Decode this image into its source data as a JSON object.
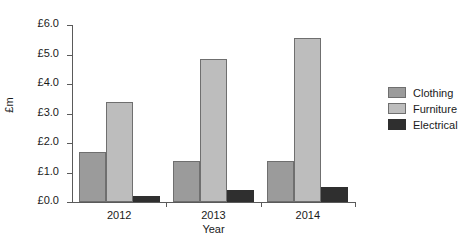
{
  "chart_data": {
    "type": "bar",
    "title": "",
    "xlabel": "Year",
    "ylabel": "£m",
    "categories": [
      "2012",
      "2013",
      "2014"
    ],
    "series": [
      {
        "name": "Clothing",
        "color": "#9b9b9b",
        "values": [
          1.7,
          1.4,
          1.4
        ]
      },
      {
        "name": "Furniture",
        "color": "#bdbdbd",
        "values": [
          3.4,
          4.85,
          5.55
        ]
      },
      {
        "name": "Electrical",
        "color": "#2f2f2f",
        "values": [
          0.2,
          0.4,
          0.5
        ]
      }
    ],
    "ylim": [
      0,
      6
    ],
    "ytick_values": [
      0,
      1,
      2,
      3,
      4,
      5,
      6
    ],
    "ytick_labels": [
      "£0.0",
      "£1.0",
      "£2.0",
      "£3.0",
      "£4.0",
      "£5.0",
      "£6.0"
    ],
    "grid": false,
    "legend_position": "right"
  }
}
